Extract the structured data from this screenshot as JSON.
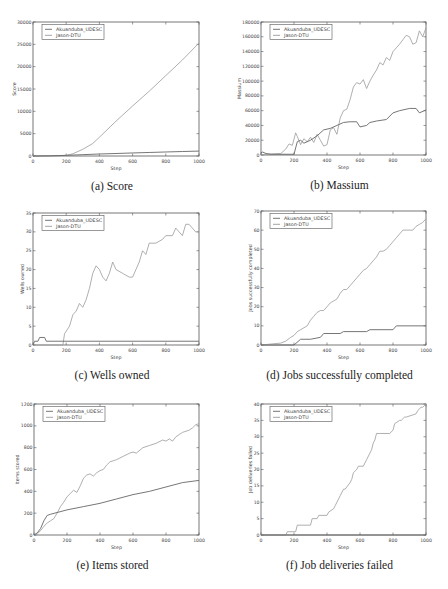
{
  "legend": [
    "Akuanduba_UDESC",
    "Jason-DTU"
  ],
  "colors": {
    "axis": "#555555",
    "series0": "#666666",
    "series1": "#9a9a9a",
    "text": "#444444"
  },
  "chart_data": [
    {
      "id": "a",
      "type": "line",
      "caption": "(a) Score",
      "title": "",
      "xlabel": "Step",
      "ylabel": "Score",
      "xlim": [
        0,
        1000
      ],
      "ylim": [
        0,
        30000
      ],
      "xticks": [
        0,
        200,
        400,
        600,
        800,
        1000
      ],
      "yticks": [
        0,
        5000,
        10000,
        15000,
        20000,
        25000,
        30000
      ],
      "box": [
        33,
        22,
        199,
        156
      ],
      "legend_position": "upper left",
      "series": [
        {
          "name": "Akuanduba_UDESC",
          "x": [
            0,
            100,
            200,
            300,
            400,
            500,
            600,
            700,
            800,
            900,
            1000
          ],
          "values": [
            0,
            30,
            150,
            300,
            450,
            560,
            680,
            790,
            900,
            1000,
            1100
          ]
        },
        {
          "name": "Jason-DTU",
          "x": [
            0,
            100,
            200,
            240,
            300,
            360,
            400,
            500,
            600,
            700,
            800,
            900,
            1000
          ],
          "values": [
            0,
            50,
            120,
            500,
            1500,
            2800,
            4200,
            7800,
            11200,
            14500,
            18000,
            21500,
            25300
          ]
        }
      ]
    },
    {
      "id": "b",
      "type": "line",
      "caption": "(b) Massium",
      "title": "",
      "xlabel": "Step",
      "ylabel": "Massium",
      "xlim": [
        0,
        1000
      ],
      "ylim": [
        0,
        180000
      ],
      "xticks": [
        0,
        200,
        400,
        600,
        800,
        1000
      ],
      "yticks": [
        0,
        20000,
        40000,
        60000,
        80000,
        100000,
        120000,
        140000,
        160000,
        180000
      ],
      "box": [
        261,
        22,
        426,
        155
      ],
      "legend_position": "upper left",
      "series": [
        {
          "name": "Akuanduba_UDESC",
          "x": [
            0,
            10,
            30,
            60,
            200,
            220,
            240,
            260,
            300,
            340,
            380,
            420,
            460,
            500,
            540,
            580,
            600,
            640,
            660,
            700,
            760,
            800,
            840,
            900,
            940,
            960,
            1000
          ],
          "values": [
            3000,
            4000,
            2000,
            1000,
            1000,
            18000,
            20000,
            16000,
            20000,
            26000,
            34000,
            36000,
            40000,
            44000,
            45000,
            45000,
            38000,
            40000,
            44000,
            46000,
            48000,
            57000,
            60000,
            63000,
            63000,
            57000,
            61000
          ]
        },
        {
          "name": "Jason-DTU",
          "x": [
            0,
            120,
            150,
            170,
            190,
            210,
            220,
            240,
            260,
            280,
            300,
            320,
            340,
            360,
            380,
            400,
            420,
            440,
            460,
            480,
            500,
            520,
            540,
            560,
            580,
            600,
            620,
            640,
            660,
            680,
            700,
            720,
            740,
            760,
            780,
            800,
            820,
            840,
            860,
            880,
            900,
            920,
            940,
            960,
            980,
            1000
          ],
          "values": [
            500,
            2000,
            8000,
            15000,
            13000,
            30000,
            25000,
            14000,
            22000,
            18000,
            24000,
            17000,
            28000,
            20000,
            12000,
            14000,
            34000,
            37000,
            28000,
            50000,
            60000,
            62000,
            75000,
            92000,
            98000,
            96000,
            102000,
            90000,
            100000,
            108000,
            115000,
            125000,
            122000,
            132000,
            128000,
            140000,
            145000,
            150000,
            156000,
            162000,
            160000,
            150000,
            152000,
            168000,
            160000,
            172000
          ]
        }
      ]
    },
    {
      "id": "c",
      "type": "line",
      "caption": "(c) Wells owned",
      "title": "",
      "xlabel": "Step",
      "ylabel": "Wells owned",
      "xlim": [
        0,
        1000
      ],
      "ylim": [
        0,
        35
      ],
      "xticks": [
        0,
        200,
        400,
        600,
        800,
        1000
      ],
      "yticks": [
        0,
        5,
        10,
        15,
        20,
        25,
        30,
        35
      ],
      "box": [
        33,
        213,
        199,
        345
      ],
      "legend_position": "upper left",
      "series": [
        {
          "name": "Akuanduba_UDESC",
          "x": [
            0,
            10,
            30,
            40,
            70,
            80,
            1000
          ],
          "values": [
            0,
            1,
            1,
            2,
            2,
            1,
            1
          ]
        },
        {
          "name": "Jason-DTU",
          "x": [
            0,
            180,
            190,
            220,
            240,
            260,
            280,
            300,
            320,
            340,
            360,
            380,
            400,
            420,
            440,
            460,
            480,
            500,
            540,
            580,
            600,
            620,
            640,
            660,
            680,
            700,
            740,
            780,
            800,
            840,
            860,
            880,
            900,
            920,
            940,
            960,
            980,
            1000
          ],
          "values": [
            0,
            0,
            3,
            5,
            8,
            9,
            11,
            10,
            12,
            15,
            19,
            21,
            20,
            18,
            17,
            19,
            22,
            20,
            19,
            18,
            18,
            20,
            22,
            25,
            24,
            27,
            27,
            28,
            29,
            29,
            31,
            30,
            29,
            32,
            32,
            31,
            30,
            30
          ]
        }
      ]
    },
    {
      "id": "d",
      "type": "line",
      "caption": "(d) Jobs successfully completed",
      "title": "",
      "xlabel": "Step",
      "ylabel": "Jobs successfully completed",
      "xlim": [
        0,
        1000
      ],
      "ylim": [
        0,
        70
      ],
      "xticks": [
        0,
        200,
        400,
        600,
        800,
        1000
      ],
      "yticks": [
        0,
        10,
        20,
        30,
        40,
        50,
        60,
        70
      ],
      "box": [
        261,
        211,
        426,
        345
      ],
      "legend_position": "upper left",
      "series": [
        {
          "name": "Akuanduba_UDESC",
          "x": [
            0,
            200,
            240,
            300,
            360,
            380,
            480,
            500,
            640,
            660,
            800,
            820,
            1000
          ],
          "values": [
            0,
            0,
            3,
            3,
            4,
            6,
            6,
            7,
            7,
            8,
            8,
            10,
            10
          ]
        },
        {
          "name": "Jason-DTU",
          "x": [
            0,
            120,
            150,
            180,
            200,
            220,
            240,
            260,
            280,
            300,
            320,
            340,
            360,
            380,
            400,
            420,
            440,
            460,
            480,
            500,
            520,
            540,
            560,
            580,
            600,
            620,
            640,
            660,
            680,
            700,
            720,
            740,
            760,
            780,
            800,
            820,
            840,
            860,
            880,
            900,
            920,
            940,
            960,
            980,
            1000
          ],
          "values": [
            0,
            1,
            2,
            4,
            5,
            7,
            8,
            9,
            10,
            13,
            15,
            17,
            18,
            18,
            20,
            22,
            23,
            24,
            27,
            29,
            29,
            31,
            33,
            35,
            37,
            39,
            40,
            42,
            44,
            46,
            49,
            49,
            50,
            52,
            54,
            56,
            58,
            60,
            60,
            60,
            60,
            62,
            63,
            64,
            66
          ]
        }
      ]
    },
    {
      "id": "e",
      "type": "line",
      "caption": "(e) Items stored",
      "title": "",
      "xlabel": "Step",
      "ylabel": "Items stored",
      "xlim": [
        0,
        1000
      ],
      "ylim": [
        0,
        1200
      ],
      "xticks": [
        0,
        200,
        400,
        600,
        800,
        1000
      ],
      "yticks": [
        0,
        200,
        400,
        600,
        800,
        1000,
        1200
      ],
      "box": [
        34,
        404,
        199,
        535
      ],
      "legend_position": "upper left",
      "series": [
        {
          "name": "Akuanduba_UDESC",
          "x": [
            0,
            20,
            40,
            60,
            80,
            100,
            150,
            200,
            300,
            400,
            500,
            600,
            700,
            800,
            900,
            1000
          ],
          "values": [
            0,
            20,
            60,
            130,
            180,
            190,
            210,
            230,
            260,
            290,
            330,
            370,
            400,
            440,
            480,
            500
          ]
        },
        {
          "name": "Jason-DTU",
          "x": [
            0,
            20,
            40,
            60,
            80,
            100,
            120,
            140,
            160,
            180,
            200,
            220,
            240,
            260,
            280,
            300,
            320,
            340,
            360,
            380,
            400,
            420,
            440,
            460,
            480,
            500,
            540,
            580,
            600,
            620,
            660,
            700,
            740,
            780,
            800,
            820,
            840,
            860,
            880,
            900,
            940,
            960,
            980,
            1000
          ],
          "values": [
            0,
            10,
            40,
            80,
            110,
            130,
            150,
            200,
            260,
            300,
            350,
            380,
            410,
            390,
            450,
            520,
            550,
            560,
            540,
            570,
            590,
            600,
            640,
            670,
            680,
            690,
            720,
            750,
            760,
            750,
            800,
            820,
            840,
            870,
            860,
            880,
            860,
            900,
            920,
            940,
            960,
            980,
            1010,
            1020
          ]
        }
      ]
    },
    {
      "id": "f",
      "type": "line",
      "caption": "(f) Job deliveries failed",
      "title": "",
      "xlabel": "Step",
      "ylabel": "Job deliveries failed",
      "xlim": [
        0,
        1000
      ],
      "ylim": [
        0,
        40
      ],
      "xticks": [
        0,
        200,
        400,
        600,
        800,
        1000
      ],
      "yticks": [
        0,
        5,
        10,
        15,
        20,
        25,
        30,
        35,
        40
      ],
      "box": [
        261,
        404,
        426,
        535
      ],
      "legend_position": "upper left",
      "series": [
        {
          "name": "Akuanduba_UDESC",
          "x": [
            0,
            1000
          ],
          "values": [
            0,
            0
          ]
        },
        {
          "name": "Jason-DTU",
          "x": [
            0,
            150,
            160,
            210,
            220,
            300,
            310,
            340,
            350,
            400,
            410,
            440,
            450,
            470,
            480,
            500,
            510,
            540,
            550,
            560,
            580,
            590,
            620,
            630,
            640,
            660,
            670,
            680,
            690,
            700,
            720,
            780,
            800,
            810,
            840,
            850,
            870,
            880,
            940,
            950,
            970,
            980,
            1000
          ],
          "values": [
            0,
            0,
            1,
            1,
            3,
            3,
            5,
            5,
            6,
            6,
            7,
            8,
            9,
            11,
            12,
            14,
            14,
            16,
            17,
            19,
            20,
            21,
            21,
            22,
            23,
            25,
            26,
            28,
            29,
            31,
            31,
            31,
            32,
            34,
            35,
            35,
            36,
            36,
            37,
            38,
            39,
            39,
            40
          ]
        }
      ]
    }
  ]
}
